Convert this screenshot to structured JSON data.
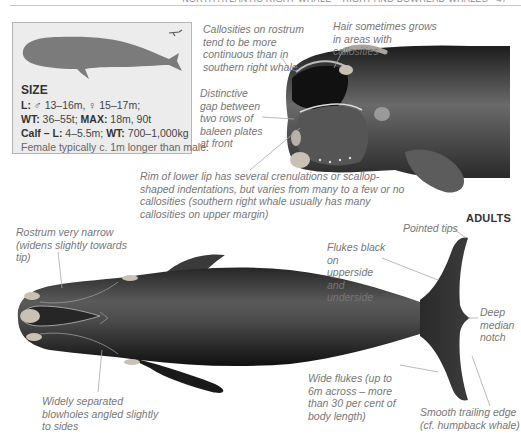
{
  "header": {
    "running_title": "North Atlantic Right Whale – Right and Bowhead Whales",
    "page_number": "47"
  },
  "size_box": {
    "title": "SIZE",
    "lines": [
      {
        "label": "L:",
        "value": " ♂ 13–16m, ♀ 15–17m;"
      },
      {
        "label": "WT:",
        "value": " 36–55t; ",
        "label2": "MAX:",
        "value2": " 18m, 90t"
      },
      {
        "label": "Calf – L:",
        "value": " 4–5.5m; ",
        "label2": "WT:",
        "value2": " 700–1,000kg"
      },
      {
        "value": "Female typically c. 1m longer than male."
      }
    ],
    "silhouette_icon": "whale-silhouette-icon",
    "diver_icon": "diver-scale-icon",
    "silhouette_color": "#7b7b7b",
    "box_color": "#ececec"
  },
  "head_annotations": {
    "callosities_rostrum": "Callosities on rostrum tend to be more continuous than in southern right whale",
    "hair": "Hair sometimes grows in areas with callosities",
    "baleen_gap": "Distinctive gap between two rows of baleen plates at front",
    "lower_lip": "Rim of lower lip has several crenulations or scallop-shaped indentations, but varies from many to a few or no callosities (southern right whale usually has many callosities on upper margin)"
  },
  "section_label": "ADULTS",
  "body_annotations": {
    "rostrum": "Rostrum very narrow (widens slightly towards tip)",
    "pointed_tips": "Pointed tips",
    "flukes_black": "Flukes black on upperside and underside",
    "deep_notch": "Deep median notch",
    "blowholes": "Widely separated blowholes angled slightly to sides",
    "wide_flukes": "Wide flukes (up to 6m across – more than 30 per cent of body length)",
    "trailing_edge": "Smooth trailing edge (cf. humpback whale)"
  },
  "colors": {
    "whale_dark": "#1a1a1a",
    "whale_mid": "#4a4a4a",
    "callosity": "#c9c2b4",
    "annotation_text": "#777777",
    "leader_line": "#aaaaaa"
  }
}
